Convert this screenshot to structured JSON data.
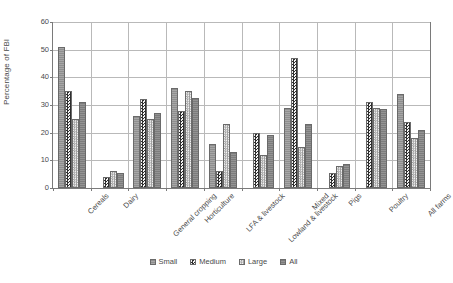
{
  "chart_data": {
    "type": "bar",
    "title": "",
    "xlabel": "",
    "ylabel": "Percentage of FBI",
    "ylim": [
      0,
      60
    ],
    "ytick_labels": [
      "0",
      "10",
      "20",
      "30",
      "40",
      "50",
      "60"
    ],
    "ytick_values": [
      0,
      10,
      20,
      30,
      40,
      50,
      60
    ],
    "grid": true,
    "legend_position": "bottom",
    "categories": [
      "Cereals",
      "Dairy",
      "General cropping",
      "Horticulture",
      "LFA & livestock",
      "Lowland & livestock",
      "Mixed",
      "Pigs",
      "Poultry",
      "All farms"
    ],
    "series": [
      {
        "name": "Small",
        "values": [
          51,
          null,
          26,
          36,
          16,
          null,
          29,
          null,
          null,
          34
        ]
      },
      {
        "name": "Medium",
        "values": [
          35,
          4,
          32,
          28,
          6,
          20,
          47,
          5.5,
          31,
          24
        ]
      },
      {
        "name": "Large",
        "values": [
          25,
          6,
          25,
          35,
          23,
          12,
          15,
          8,
          29,
          18
        ]
      },
      {
        "name": "All",
        "values": [
          31,
          5.5,
          27,
          32.5,
          13,
          19,
          23,
          8.5,
          28.5,
          21
        ]
      }
    ]
  },
  "legend": {
    "items": [
      {
        "label": "Small",
        "key": "s-small"
      },
      {
        "label": "Medium",
        "key": "s-medium"
      },
      {
        "label": "Large",
        "key": "s-large"
      },
      {
        "label": "All",
        "key": "s-all"
      }
    ]
  },
  "colors": {
    "small": "#8e8e8e",
    "medium": "#2f2f2f",
    "large": "#9a9a9a",
    "all": "#7c7c7c",
    "gridline": "#b9b9b9",
    "axis": "#7a7a7a",
    "text": "#4a4a4a",
    "background": "#ffffff"
  }
}
